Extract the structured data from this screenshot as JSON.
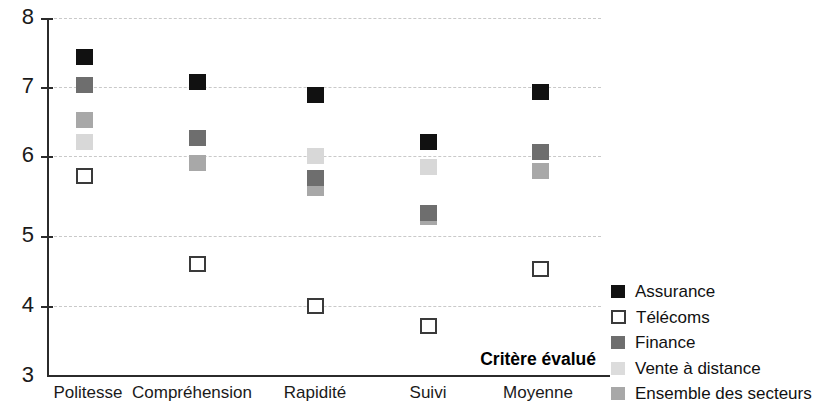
{
  "chart_data": {
    "type": "scatter",
    "title": "",
    "xlabel": "Critère évalué",
    "ylabel": "",
    "categories": [
      "Politesse",
      "Compréhension",
      "Rapidité",
      "Suivi",
      "Moyenne"
    ],
    "ylim": [
      3,
      8
    ],
    "yticks": [
      3,
      4,
      5,
      6,
      7,
      8
    ],
    "grid": true,
    "legend_position": "right",
    "series": [
      {
        "name": "Assurance",
        "marker": "filled-square",
        "color": "#111111",
        "values": [
          7.45,
          7.1,
          6.93,
          6.27,
          6.97
        ]
      },
      {
        "name": "Télécoms",
        "marker": "open-square",
        "color": "#ffffff",
        "values": [
          5.8,
          4.57,
          3.98,
          3.7,
          4.5
        ]
      },
      {
        "name": "Finance",
        "marker": "filled-square",
        "color": "#6e6e6e",
        "values": [
          7.07,
          6.32,
          5.77,
          5.28,
          6.13
        ]
      },
      {
        "name": "Vente à distance",
        "marker": "filled-square",
        "color": "#d8d8d8",
        "values": [
          6.27,
          5.98,
          6.07,
          5.92,
          5.87
        ]
      },
      {
        "name": "Ensemble des secteurs",
        "marker": "filled-square",
        "color": "#a8a8a8",
        "values": [
          6.58,
          5.98,
          5.63,
          5.22,
          5.87
        ]
      }
    ]
  },
  "axis": {
    "tick_labels": [
      "8",
      "7",
      "6",
      "5",
      "4",
      "3"
    ],
    "x_title": "Critère évalué"
  },
  "legend": {
    "items": [
      {
        "label": "Assurance"
      },
      {
        "label": "Télécoms"
      },
      {
        "label": "Finance"
      },
      {
        "label": "Vente à distance"
      },
      {
        "label": "Ensemble des secteurs"
      }
    ]
  }
}
